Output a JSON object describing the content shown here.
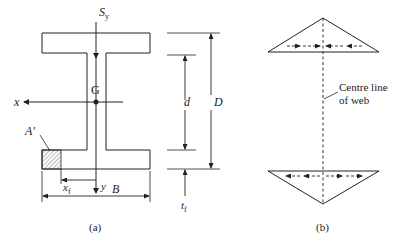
{
  "figure_a": {
    "caption": "(a)",
    "shear_force": {
      "symbol": "S",
      "subscript": "y"
    },
    "centroid": "G",
    "x_axis": "x",
    "y_axis": "y",
    "area_label": "A'",
    "x_distance": {
      "symbol": "x",
      "subscript": "f"
    },
    "flange_width": "B",
    "web_depth": "d",
    "total_depth": "D",
    "flange_thickness": {
      "symbol": "t",
      "subscript": "f"
    }
  },
  "figure_b": {
    "caption": "(b)",
    "annotation_line1": "Centre line",
    "annotation_line2": "of web"
  },
  "colors": {
    "line": "#222222",
    "background": "#ffffff"
  }
}
